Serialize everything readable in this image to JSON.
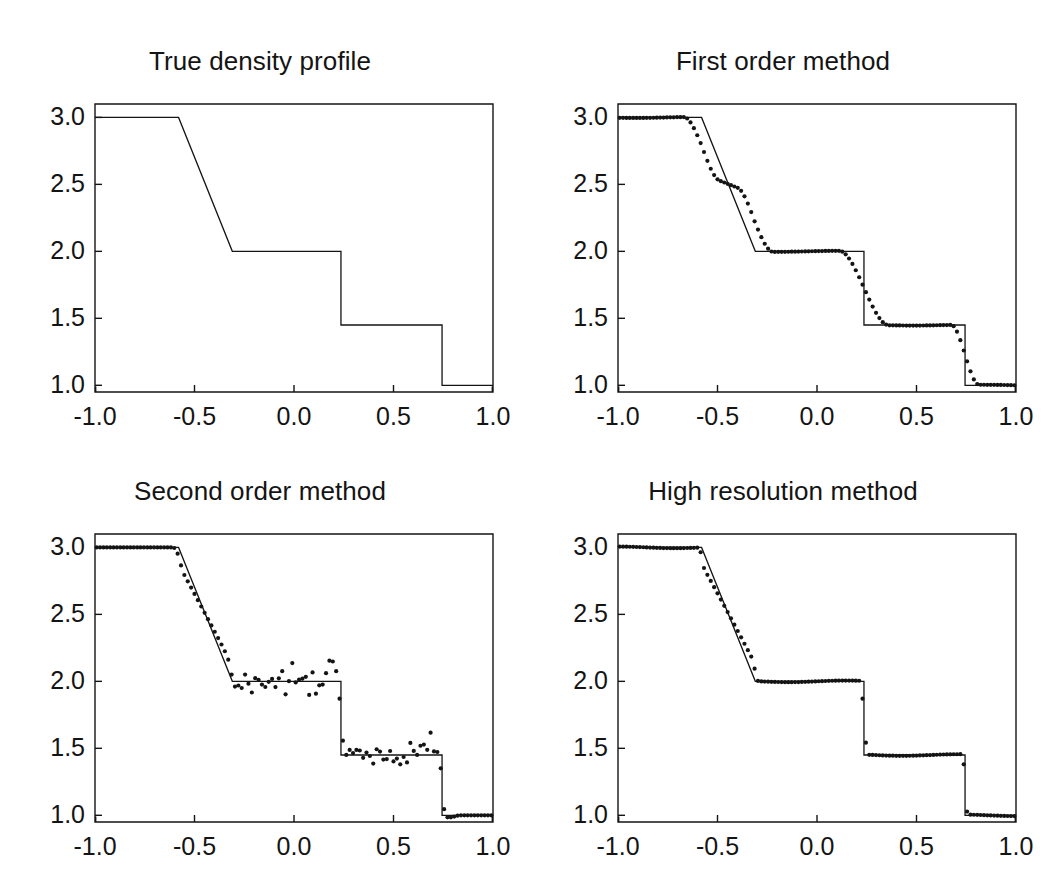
{
  "figure": {
    "title": "",
    "rows": 2,
    "columns": 2,
    "background": "#ffffff",
    "foreground": "#141414"
  },
  "axes": {
    "x_ticks": [
      "-1.0",
      "-0.5",
      "0.0",
      "0.5",
      "1.0"
    ],
    "x_tick_values": [
      -1.0,
      -0.5,
      0.0,
      0.5,
      1.0
    ],
    "y_ticks": [
      "1.0",
      "1.5",
      "2.0",
      "2.5",
      "3.0"
    ],
    "y_tick_values": [
      1.0,
      1.5,
      2.0,
      2.5,
      3.0
    ],
    "xlim": [
      -1.0,
      1.0
    ],
    "ylim": [
      0.95,
      3.1
    ],
    "xlabel": "",
    "ylabel": "",
    "grid": false,
    "tick_direction": "in",
    "box": true
  },
  "panels": [
    {
      "id": "true-density-profile",
      "title": "True density profile",
      "has_markers": false
    },
    {
      "id": "first-order-method",
      "title": "First order method",
      "has_markers": true
    },
    {
      "id": "second-order-method",
      "title": "Second order method",
      "has_markers": true
    },
    {
      "id": "high-resolution-method",
      "title": "High resolution method",
      "has_markers": true
    }
  ],
  "chart_data": {
    "type": "line",
    "xlabel": "",
    "ylabel": "density",
    "xlim": [
      -1.0,
      1.0
    ],
    "ylim": [
      0.95,
      3.1
    ],
    "grid": false,
    "legend_position": "none",
    "reference_solution": {
      "name": "Exact (true) density profile",
      "style": "thin solid black line",
      "description": "Left state 3.0; rarefaction fan from x=-0.58 down to 2.0 at x=-0.31; constant 2.0 plateau to the contact discontinuity at x=0.236 where it drops to 1.45; constant 1.45 plateau to the shock at x=0.744 where it drops to 1.0; constant 1.0 to x=1.0",
      "x": [
        -1.0,
        -0.58,
        -0.31,
        0.236,
        0.236,
        0.744,
        0.744,
        1.0
      ],
      "y": [
        3.0,
        3.0,
        2.0,
        2.0,
        1.45,
        1.45,
        1.0,
        1.0
      ],
      "features": {
        "left_state": 3.0,
        "rarefaction_start_x": -0.58,
        "rarefaction_end_x": -0.31,
        "star_left_density": 2.0,
        "contact_x": 0.236,
        "star_right_density": 1.45,
        "shock_x": 0.744,
        "right_state": 1.0
      }
    },
    "series": [
      {
        "name": "True density profile",
        "panel": "true-density-profile",
        "marker": "none",
        "note": "Exact solution only; no computed grid points plotted"
      },
      {
        "name": "First order method",
        "panel": "first-order-method",
        "marker": "filled circle",
        "note": "Heavily smeared: the contact discontinuity is spread over roughly 15 cells and the shock over roughly 8 cells; corners of the rarefaction are rounded; no oscillations",
        "smearing": {
          "contact_cells": 15,
          "shock_cells": 8,
          "rarefaction_corner_cells": 12
        },
        "overshoot": 0.0
      },
      {
        "name": "Second order method",
        "panel": "second-order-method",
        "marker": "filled circle",
        "note": "Sharp discontinuities but strong spurious oscillations on the constant states; scatter of about +/-0.12 on the 2.0 plateau and about +/-0.08 on the 1.45 plateau, with overshoots just ahead of the contact and the shock",
        "smearing": {
          "contact_cells": 3,
          "shock_cells": 3,
          "rarefaction_corner_cells": 4
        },
        "oscillation_amplitude_plateau_2": 0.12,
        "oscillation_amplitude_plateau_1p45": 0.08,
        "overshoot": 0.12
      },
      {
        "name": "High resolution method",
        "panel": "high-resolution-method",
        "marker": "filled circle",
        "note": "Sharp, monotone and oscillation-free: the contact is captured in about 3 cells and the shock in about 2 cells, with the constant states reproduced exactly",
        "smearing": {
          "contact_cells": 3,
          "shock_cells": 2,
          "rarefaction_corner_cells": 2
        },
        "oscillation_amplitude_plateau_2": 0.0,
        "overshoot": 0.0
      }
    ]
  }
}
